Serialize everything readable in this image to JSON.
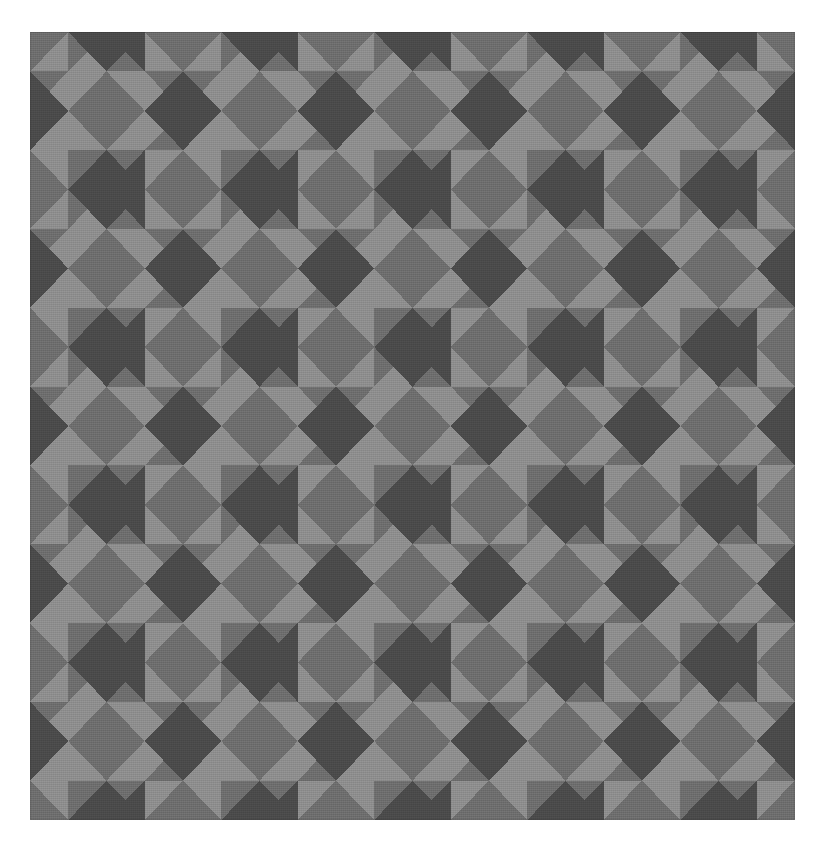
{
  "page": {
    "background_color": "#ffffff",
    "width": 826,
    "height": 857
  },
  "figure": {
    "name": "tiled-diamond-square-pattern",
    "left": 30,
    "top": 32,
    "width": 765,
    "height": 788
  },
  "palette": {
    "light": "#8e8e8e",
    "mid": "#6e6e6e",
    "dark": "#4b4b4b",
    "background": "#ffffff"
  },
  "grid": {
    "columns": 10,
    "rows": 10,
    "cell_width": 76.5,
    "cell_height": 78.8,
    "motif_period_cells": 2
  },
  "chart_data": {
    "type": "heatmap",
    "xlabel": "",
    "ylabel": "",
    "grid": false,
    "legend": "none",
    "categories": [
      "c0",
      "c1",
      "c2",
      "c3",
      "c4",
      "c5",
      "c6",
      "c7",
      "c8",
      "c9"
    ],
    "rows": [
      "r0",
      "r1",
      "r2",
      "r3",
      "r4",
      "r5",
      "r6",
      "r7",
      "r8",
      "r9"
    ],
    "tile_types": {
      "A": "corner-cell: top+bottom triangles dark, left+right triangles mid",
      "B": "center-cell: top+bottom triangles mid, left+right triangles dark, forming light square when paired",
      "L": "light square cell",
      "M": "mid square cell"
    },
    "note": "Parity rule: a cell at (row r, col c) renders its four triangles from the palette based on (r+c) parity; even-parity cells carry the light square motif and odd-parity cells carry the dark diamond motif.",
    "values": [
      [
        0,
        1,
        0,
        1,
        0,
        1,
        0,
        1,
        0,
        1
      ],
      [
        1,
        0,
        1,
        0,
        1,
        0,
        1,
        0,
        1,
        0
      ],
      [
        0,
        1,
        0,
        1,
        0,
        1,
        0,
        1,
        0,
        1
      ],
      [
        1,
        0,
        1,
        0,
        1,
        0,
        1,
        0,
        1,
        0
      ],
      [
        0,
        1,
        0,
        1,
        0,
        1,
        0,
        1,
        0,
        1
      ],
      [
        1,
        0,
        1,
        0,
        1,
        0,
        1,
        0,
        1,
        0
      ],
      [
        0,
        1,
        0,
        1,
        0,
        1,
        0,
        1,
        0,
        1
      ],
      [
        1,
        0,
        1,
        0,
        1,
        0,
        1,
        0,
        1,
        0
      ],
      [
        0,
        1,
        0,
        1,
        0,
        1,
        0,
        1,
        0,
        1
      ],
      [
        1,
        0,
        1,
        0,
        1,
        0,
        1,
        0,
        1,
        0
      ]
    ]
  }
}
